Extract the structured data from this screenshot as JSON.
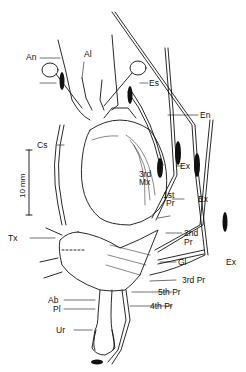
{
  "figure": {
    "scale_bar": {
      "label": "10 mm"
    },
    "labels": {
      "an": "An",
      "al": "Al",
      "es": "Es",
      "en": "En",
      "cs": "Cs",
      "ex1": "Ex",
      "ex2": "Ex",
      "ex3": "Ex",
      "mx3_a": "3rd",
      "mx3_b": "Mx",
      "pr1_a": "1st",
      "pr1_b": "Pr",
      "pr2_a": "2nd",
      "pr2_b": "Pr",
      "tx": "Tx",
      "gl": "Gl",
      "pr3": "3rd Pr",
      "pr5": "5th Pr",
      "pr4": "4th Pr",
      "ab": "Ab",
      "pl": "Pl",
      "ur": "Ur"
    }
  }
}
